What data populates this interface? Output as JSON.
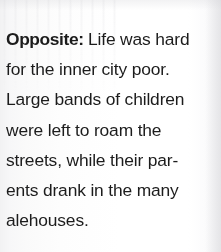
{
  "document": {
    "type": "book-caption",
    "background_color": "#fbfbfb",
    "text_color": "#1c1c1c",
    "caption": {
      "lead_in": "Opposite:",
      "lines": [
        "Life was hard",
        "for the inner city poor.",
        "Large bands of children",
        "were left to roam the",
        "streets, while their par-",
        "ents drank in the many",
        "alehouses."
      ],
      "full_text": "Opposite: Life was hard for the inner city poor. Large bands of children were left to roam the streets, while their parents drank in the many alehouses."
    }
  }
}
